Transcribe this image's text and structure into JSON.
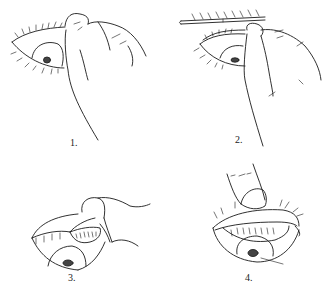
{
  "figure": {
    "type": "line-drawing",
    "background_color": "#ffffff",
    "ink_color": "#1a1a1a",
    "panels": [
      {
        "label": "1.",
        "description": "fingers grasp upper eyelashes of open eye"
      },
      {
        "label": "2.",
        "description": "applicator stick placed across upper lid while lashes pulled"
      },
      {
        "label": "3.",
        "description": "lid folded back over stick revealing inner surface"
      },
      {
        "label": "4.",
        "description": "thumb holds everted lid against brow"
      }
    ]
  }
}
